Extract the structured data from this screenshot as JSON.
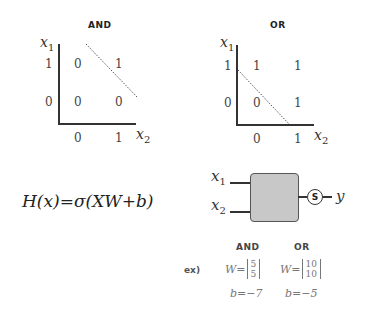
{
  "and_plot": {
    "title": "AND",
    "y_label": "x",
    "y_label_sub": "1",
    "x_label": "x",
    "x_label_sub": "2",
    "y_ticks": [
      "1",
      "0"
    ],
    "x_ticks": [
      "0",
      "1"
    ],
    "cells": [
      [
        "0",
        "1"
      ],
      [
        "0",
        "0"
      ]
    ]
  },
  "or_plot": {
    "title": "OR",
    "y_label": "x",
    "y_label_sub": "1",
    "x_label": "x",
    "x_label_sub": "2",
    "y_ticks": [
      "1",
      "0"
    ],
    "x_ticks": [
      "0",
      "1"
    ],
    "cells": [
      [
        "1",
        "1"
      ],
      [
        "0",
        "1"
      ]
    ]
  },
  "formula": "H(x)=σ(XW+b)",
  "neuron": {
    "input1": "x",
    "input1_sub": "1",
    "input2": "x",
    "input2_sub": "2",
    "activation": "S",
    "output": "y",
    "box_color": "#c8c8c8"
  },
  "examples": {
    "prefix": "ex)",
    "and": {
      "label": "AND",
      "w_top": "5",
      "w_bottom": "5",
      "b": "b=−7"
    },
    "or": {
      "label": "OR",
      "w_top": "10",
      "w_bottom": "10",
      "b": "b=−5"
    },
    "w_prefix": "W="
  }
}
